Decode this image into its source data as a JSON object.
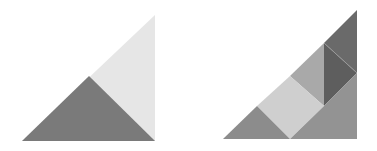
{
  "figures": [
    {
      "name": "left-figure",
      "pieces": [
        {
          "name": "light-triangle",
          "points": "155,15 22,141 155,141",
          "fill": "#e6e6e6"
        },
        {
          "name": "dark-triangle",
          "points": "22,141 89,76 155,141",
          "fill": "#7a7a7a"
        }
      ]
    },
    {
      "name": "right-figure",
      "pieces": [
        {
          "name": "top-dark-triangle",
          "points": "357,10 324,43 357,73",
          "fill": "#6a6a6a"
        },
        {
          "name": "middle-dark-triangle",
          "points": "324,43 357,73 324,106",
          "fill": "#5e5e5e"
        },
        {
          "name": "medium-triangle",
          "points": "324,43 290,76 324,106",
          "fill": "#a9a9a9"
        },
        {
          "name": "light-square",
          "points": "290,76 324,106 290,139 257,106",
          "fill": "#cfcfcf"
        },
        {
          "name": "bottom-left-triangle",
          "points": "257,106 290,139 223,139",
          "fill": "#8c8c8c"
        },
        {
          "name": "bottom-right-trapezoid",
          "points": "324,106 357,73 357,139 290,139",
          "fill": "#939393"
        }
      ],
      "separator_line": {
        "x1": 324,
        "y1": 43,
        "x2": 357,
        "y2": 73,
        "stroke": "#9a9a9a"
      }
    }
  ]
}
